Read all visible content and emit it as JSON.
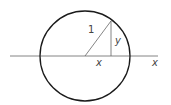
{
  "diagram": {
    "type": "unit-circle",
    "labels": {
      "radius": "1",
      "opposite": "y",
      "adjacent": "x",
      "axis": "x"
    },
    "colors": {
      "circle": "#1a1a1a",
      "lines": "#555555",
      "text": "#444444"
    }
  }
}
